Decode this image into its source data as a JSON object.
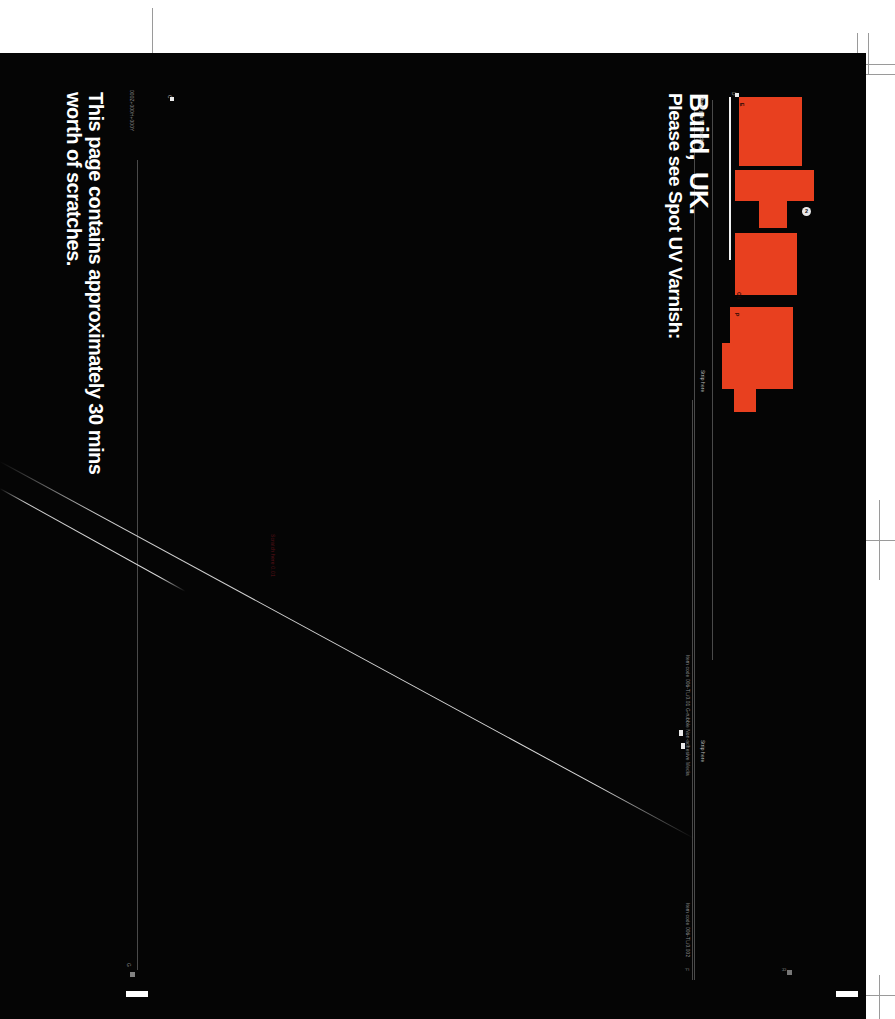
{
  "document": {
    "type": "print-proof",
    "orientation": "rotated-90",
    "background": "#050505",
    "accent_color": "#e8401f",
    "white": "#ffffff"
  },
  "headline": {
    "varnish_instruction": "Please see Spot UV Varnish:"
  },
  "brand": {
    "name": "Build,",
    "region": "UK.",
    "tagline": "Thank you for scratching"
  },
  "copy": {
    "line1": "This page contains approximately 30 mins",
    "line2": "worth of scratches."
  },
  "specs": {
    "dimensions": "000Z+000H+000Y",
    "item_code_top": "Item code 006-TL/0.01 G-rubble Non-adhesive Media",
    "item_code_bottom": "Item code 006-TL/0.002",
    "trim_label_a": "A",
    "trim_label_b": "B"
  },
  "markers": {
    "strip_here_1": "Strip here",
    "strip_here_2": "Strip here",
    "circle_1": "1",
    "circle_2": "2",
    "tab_c": "C",
    "tab_d": "D",
    "tab_e": "E",
    "tab_f": "F",
    "tab_ch": "CH",
    "tab_p": "P",
    "tab_g": "G",
    "tab_r": "R"
  },
  "annotations": {
    "red_note": "Scratch here 0.01"
  },
  "shapes": {
    "red_panels": [
      {
        "name": "panel-d",
        "x": 739,
        "y": 97,
        "w": 63,
        "h": 69
      },
      {
        "name": "panel-e",
        "x": 735,
        "y": 170,
        "w": 79,
        "h": 30
      },
      {
        "name": "panel-e-tab",
        "x": 759,
        "y": 200,
        "w": 28,
        "h": 27
      },
      {
        "name": "panel-ch",
        "x": 735,
        "y": 232,
        "w": 62,
        "h": 62
      },
      {
        "name": "panel-p",
        "x": 730,
        "y": 307,
        "w": 63,
        "h": 35
      },
      {
        "name": "panel-p-lower",
        "x": 722,
        "y": 342,
        "w": 71,
        "h": 47
      },
      {
        "name": "panel-p-foot",
        "x": 734,
        "y": 389,
        "w": 22,
        "h": 22
      }
    ]
  }
}
